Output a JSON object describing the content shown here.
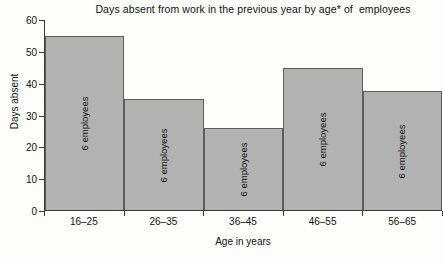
{
  "chart_data": {
    "type": "bar",
    "title": "Days absent from work in the previous year by age* of  employees",
    "xlabel": "Age in years",
    "ylabel": "Days absent",
    "categories": [
      "16–25",
      "26–35",
      "36–45",
      "46–55",
      "56–65"
    ],
    "values": [
      55,
      35,
      26,
      45,
      37.5
    ],
    "bar_annotations": [
      "6 employees",
      "6 employees",
      "6 employees",
      "6 employees",
      "6 employees"
    ],
    "ylim": [
      0,
      60
    ],
    "yticks": [
      0,
      10,
      20,
      30,
      40,
      50,
      60
    ],
    "ytick_labels": [
      "0",
      "10",
      "20",
      "30",
      "40",
      "50",
      "60"
    ],
    "grid": false,
    "legend": null,
    "bar_fill_color": "#b2b2b2",
    "bar_edge_color": "#5d5d5d",
    "axis_color": "#3a3a3a",
    "contiguous_bars": true
  }
}
